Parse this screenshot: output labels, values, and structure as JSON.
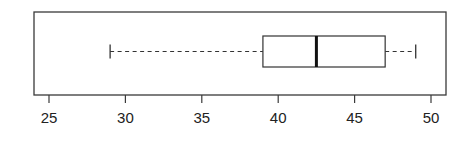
{
  "chart_data": {
    "type": "boxplot",
    "orientation": "horizontal",
    "title": "",
    "xlabel": "",
    "ylabel": "",
    "xlim": [
      24,
      50.8
    ],
    "x_ticks": [
      25,
      30,
      35,
      40,
      45,
      50
    ],
    "x_tick_labels": [
      "25",
      "30",
      "35",
      "40",
      "45",
      "50"
    ],
    "grid": false,
    "legend": "none",
    "boxes": [
      {
        "name": "",
        "whisker_low": 29,
        "q1": 39,
        "median": 42.5,
        "q3": 47,
        "whisker_high": 49,
        "outliers": []
      }
    ]
  }
}
